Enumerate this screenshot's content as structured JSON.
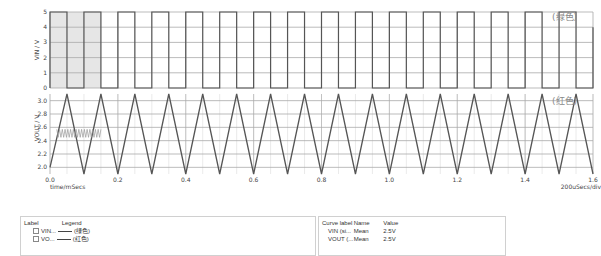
{
  "chart_data": [
    {
      "type": "line",
      "title": "",
      "xlabel": "time/mSecs",
      "ylabel": "VIN / V",
      "x_range": [
        0.0,
        1.6
      ],
      "ylim": [
        0,
        5
      ],
      "yticks": [
        "0",
        "1",
        "2",
        "3",
        "4",
        "5"
      ],
      "grid": true,
      "series": [
        {
          "name": "VIN",
          "shape": "square",
          "period_ms": 0.1,
          "duty": 0.5,
          "low": 0,
          "high": 5,
          "cycles": 16,
          "annotation": "(绿色)"
        }
      ],
      "highlight_region_ms": [
        0.0,
        0.15
      ]
    },
    {
      "type": "line",
      "title": "",
      "xlabel": "time/mSecs",
      "ylabel": "VOUT / V",
      "x_range": [
        0.0,
        1.6
      ],
      "xticks": [
        "0.0",
        "0.2",
        "0.4",
        "0.6",
        "0.8",
        "1.0",
        "1.2",
        "1.4",
        "1.6"
      ],
      "ylim": [
        1.9,
        3.1
      ],
      "yticks": [
        "2.0",
        "2.2",
        "2.4",
        "2.6",
        "2.8",
        "3.0"
      ],
      "grid": true,
      "series": [
        {
          "name": "VOUT",
          "shape": "triangle",
          "period_ms": 0.1,
          "min": 1.9,
          "max": 3.1,
          "start": 2.0,
          "cycles": 16,
          "annotation": "(红色)"
        },
        {
          "name": "VOUT ripple (zoomed inset)",
          "shape": "zigzag",
          "x_range_ms": [
            0.02,
            0.15
          ],
          "min": 2.45,
          "max": 2.57,
          "teeth": 16
        }
      ],
      "x_scale_note": "200uSecs/div"
    }
  ],
  "plot": {
    "top_ylabel": "VIN / V",
    "bottom_ylabel": "VOUT / V",
    "top_note": "(绿色)",
    "bottom_note": "(红色)",
    "xlabel": "time/mSecs",
    "scale_label": "200uSecs/div"
  },
  "legend_panel": {
    "headers": {
      "label": "Label",
      "legend": "Legend"
    },
    "rows": [
      {
        "label": "VIN...",
        "legend": "(绿色)"
      },
      {
        "label": "VO...",
        "legend": "(红色)"
      }
    ]
  },
  "value_panel": {
    "headers": {
      "curve_label": "Curve label",
      "name": "Name",
      "value": "Value"
    },
    "rows": [
      {
        "curve_label": "VIN (si...",
        "name": "Mean",
        "value": "2.5V"
      },
      {
        "curve_label": "VOUT (...",
        "name": "Mean",
        "value": "2.5V"
      }
    ]
  }
}
